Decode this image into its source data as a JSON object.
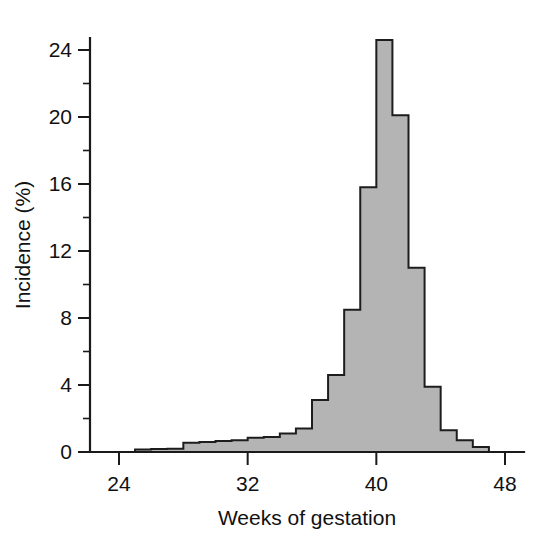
{
  "chart_data": {
    "type": "bar",
    "title": "",
    "xlabel": "Weeks of gestation",
    "ylabel": "Incidence (%)",
    "xlim": [
      23,
      49
    ],
    "ylim": [
      0,
      25.5
    ],
    "grid": false,
    "legend": null,
    "bin_width_weeks": 1,
    "x_ticks_major": [
      24,
      32,
      40,
      48
    ],
    "x_tick_labels": [
      "24",
      "32",
      "40",
      "48"
    ],
    "y_ticks_major": [
      0,
      4,
      8,
      12,
      16,
      20,
      24
    ],
    "y_tick_labels": [
      "0",
      "4",
      "8",
      "12",
      "16",
      "20",
      "24"
    ],
    "y_ticks_minor": [
      2,
      6,
      10,
      14,
      18,
      22
    ],
    "style": {
      "fill_color": "#b4b4b4",
      "edge_color": "#1d1d1d",
      "background_color": "#ffffff",
      "axis_color": "#1a1a1a"
    },
    "categories": [
      "24",
      "25",
      "26",
      "27",
      "28",
      "29",
      "30",
      "31",
      "32",
      "33",
      "34",
      "35",
      "36",
      "37",
      "38",
      "39",
      "40",
      "41",
      "42",
      "43",
      "44",
      "45",
      "46",
      "47"
    ],
    "values": [
      0.0,
      0.15,
      0.18,
      0.2,
      0.55,
      0.6,
      0.65,
      0.7,
      0.85,
      0.9,
      1.1,
      1.4,
      3.1,
      4.6,
      8.5,
      15.8,
      24.6,
      20.1,
      11.0,
      3.9,
      1.3,
      0.7,
      0.3,
      0.0
    ],
    "peak": {
      "week": 40,
      "incidence": 24.6
    }
  },
  "axis": {
    "y_label": "Incidence (%)",
    "x_label": "Weeks of gestation"
  }
}
